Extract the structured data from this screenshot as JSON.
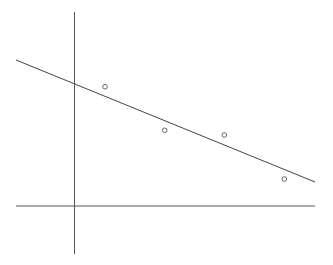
{
  "diagram": {
    "width": 333,
    "height": 265,
    "background": "#ffffff",
    "colors": {
      "axis": "#555555",
      "line": "#444444",
      "point": "#555555"
    },
    "y_axis": {
      "x1": 74.5,
      "y1": 12,
      "x2": 74.5,
      "y2": 254
    },
    "x_axis": {
      "x1": 16,
      "y1": 206,
      "x2": 315,
      "y2": 206
    },
    "fit_line": {
      "x1": 16,
      "y1": 60,
      "x2": 315,
      "y2": 182
    },
    "points": [
      {
        "cx": 105,
        "cy": 86.7,
        "r": 2.3
      },
      {
        "cx": 164.7,
        "cy": 130.3,
        "r": 2.3
      },
      {
        "cx": 224.3,
        "cy": 135,
        "r": 2.3
      },
      {
        "cx": 284.3,
        "cy": 179,
        "r": 2.3
      }
    ]
  }
}
